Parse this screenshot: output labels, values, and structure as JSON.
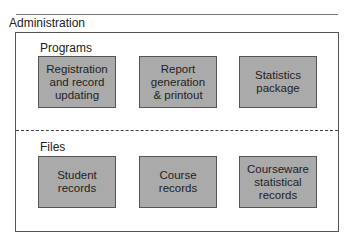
{
  "title": "Administration",
  "sections": [
    {
      "label": "Programs",
      "boxes": [
        {
          "label": "Registration\nand record\nupdating"
        },
        {
          "label": "Report\ngeneration\n& printout"
        },
        {
          "label": "Statistics\npackage"
        }
      ]
    },
    {
      "label": "Files",
      "boxes": [
        {
          "label": "Student\nrecords"
        },
        {
          "label": "Course\nrecords"
        },
        {
          "label": "Courseware\nstatistical\nrecords"
        }
      ]
    }
  ],
  "colors": {
    "box_fill": "#aaaaaa",
    "border": "#555555"
  }
}
